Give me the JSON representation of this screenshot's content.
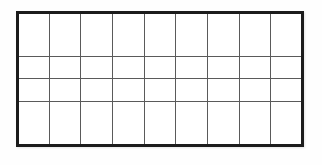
{
  "page": {
    "kind": "blank-grid-graphic",
    "width": 322,
    "height": 165,
    "background_color": "#fefefe"
  },
  "grid": {
    "name": "blank-grid",
    "columns": 9,
    "rows": 4,
    "x": 16,
    "y": 11,
    "width": 288,
    "height": 136,
    "cell_width": 32,
    "cell_height": 34,
    "outer_border_color": "#1c1c1c",
    "outer_border_width": 3,
    "inner_line_color": "#5a5a5a",
    "inner_line_width": 1,
    "cell_fill_color": "#ffffff",
    "column_line_x": [
      16,
      48,
      80,
      112,
      144,
      176,
      208,
      240,
      272,
      304
    ],
    "row_line_y": [
      11,
      45,
      79,
      113,
      147
    ],
    "cells": [
      [
        "",
        "",
        "",
        "",
        "",
        "",
        "",
        "",
        ""
      ],
      [
        "",
        "",
        "",
        "",
        "",
        "",
        "",
        "",
        ""
      ],
      [
        "",
        "",
        "",
        "",
        "",
        "",
        "",
        "",
        ""
      ],
      [
        "",
        "",
        "",
        "",
        "",
        "",
        "",
        "",
        ""
      ]
    ]
  }
}
